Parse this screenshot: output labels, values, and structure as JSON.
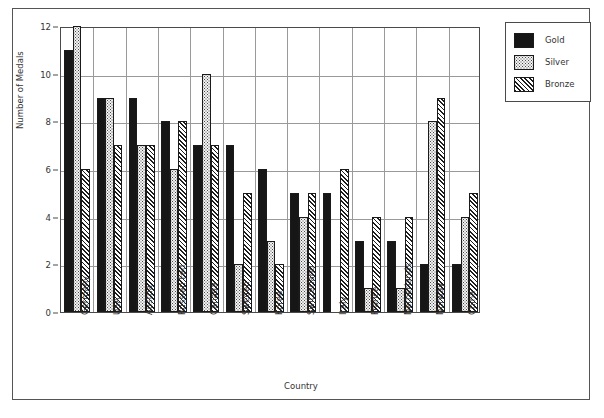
{
  "figure": {
    "x_axis_title": "Country",
    "y_axis_title": "Number of Medals"
  },
  "legend": {
    "items": [
      {
        "label": "Gold",
        "swatch": "solid-black-swatch",
        "color": "#161616"
      },
      {
        "label": "Silver",
        "swatch": "dotted-light-swatch",
        "color": "#f2f2f2"
      },
      {
        "label": "Bronze",
        "swatch": "diagonal-hatch-swatch",
        "color": "#1d1d1d"
      }
    ]
  },
  "chart_data": {
    "type": "bar",
    "title": "",
    "xlabel": "Country",
    "ylabel": "Number of Medals",
    "ylim": [
      0,
      12
    ],
    "yticks": [
      0,
      2,
      4,
      6,
      8,
      10,
      12
    ],
    "grid": true,
    "legend_position": "top-right",
    "categories": [
      "Germany",
      "USA",
      "Austria",
      "Russian Fed.",
      "Canada",
      "Sweden",
      "Korea",
      "Switzerland",
      "Italy",
      "France",
      "Netherlands",
      "Norway",
      "China"
    ],
    "series": [
      {
        "name": "Gold",
        "values": [
          11,
          9,
          9,
          8,
          7,
          7,
          6,
          5,
          5,
          3,
          3,
          2,
          2
        ]
      },
      {
        "name": "Silver",
        "values": [
          12,
          9,
          7,
          6,
          10,
          2,
          3,
          4,
          0,
          1,
          1,
          8,
          4
        ]
      },
      {
        "name": "Bronze",
        "values": [
          6,
          7,
          7,
          8,
          7,
          5,
          2,
          5,
          6,
          4,
          4,
          9,
          5
        ]
      }
    ]
  }
}
